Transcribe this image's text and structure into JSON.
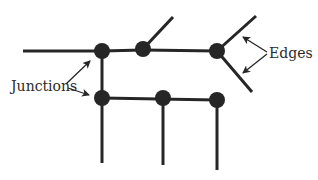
{
  "labels": {
    "junctions": "Junctions",
    "edges": "Edges"
  },
  "colors": {
    "line": "#262626",
    "node": "#262626",
    "text": "#2a2a2a",
    "background": "#ffffff"
  },
  "nodes": [
    {
      "id": "n1",
      "x": 102,
      "y": 51
    },
    {
      "id": "n2",
      "x": 143,
      "y": 49
    },
    {
      "id": "n3",
      "x": 217,
      "y": 51
    },
    {
      "id": "n4",
      "x": 102,
      "y": 98
    },
    {
      "id": "n5",
      "x": 163,
      "y": 98
    },
    {
      "id": "n6",
      "x": 217,
      "y": 100
    }
  ],
  "edges": [
    {
      "from": [
        23,
        51
      ],
      "to": [
        102,
        51
      ]
    },
    {
      "from": [
        102,
        51
      ],
      "to": [
        143,
        50
      ]
    },
    {
      "from": [
        143,
        50
      ],
      "to": [
        217,
        51
      ]
    },
    {
      "from": [
        143,
        49
      ],
      "to": [
        173,
        17
      ]
    },
    {
      "from": [
        217,
        51
      ],
      "to": [
        256,
        16
      ]
    },
    {
      "from": [
        217,
        51
      ],
      "to": [
        252,
        92
      ]
    },
    {
      "from": [
        102,
        51
      ],
      "to": [
        102,
        98
      ]
    },
    {
      "from": [
        102,
        98
      ],
      "to": [
        217,
        100
      ]
    },
    {
      "from": [
        102,
        98
      ],
      "to": [
        102,
        163
      ]
    },
    {
      "from": [
        163,
        98
      ],
      "to": [
        163,
        165
      ]
    },
    {
      "from": [
        217,
        100
      ],
      "to": [
        217,
        170
      ]
    }
  ]
}
